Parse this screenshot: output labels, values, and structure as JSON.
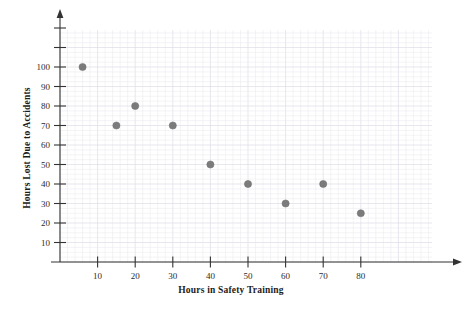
{
  "chart_data": {
    "type": "scatter",
    "title": "",
    "xlabel": "Hours in Safety Training",
    "ylabel": "Hours Lost Due to Accidents",
    "xlim": [
      0,
      95
    ],
    "ylim": [
      0,
      118
    ],
    "xticks": [
      10,
      20,
      30,
      40,
      50,
      60,
      70,
      80
    ],
    "yticks": [
      10,
      20,
      30,
      40,
      50,
      60,
      70,
      80,
      90,
      100
    ],
    "grid": true,
    "legend": "none",
    "point_color": "#7b7b7b",
    "axis_color": "#333333",
    "grid_color": "#e9e9ef",
    "points": [
      {
        "x": 6,
        "y": 100
      },
      {
        "x": 15,
        "y": 70
      },
      {
        "x": 20,
        "y": 80
      },
      {
        "x": 30,
        "y": 70
      },
      {
        "x": 40,
        "y": 50
      },
      {
        "x": 50,
        "y": 40
      },
      {
        "x": 60,
        "y": 30
      },
      {
        "x": 70,
        "y": 40
      },
      {
        "x": 80,
        "y": 25
      }
    ]
  }
}
